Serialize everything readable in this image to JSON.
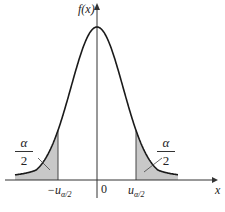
{
  "chart_data": {
    "type": "line",
    "title": "",
    "xlabel": "x",
    "ylabel": "f(x)",
    "tick_labels": [
      "-u_{α/2}",
      "0",
      "u_{α/2}"
    ],
    "annotations": [
      {
        "text": "α/2",
        "position": "left tail"
      },
      {
        "text": "α/2",
        "position": "right tail"
      }
    ],
    "shaded_regions": [
      "x < -u_{α/2}",
      "x > u_{α/2}"
    ],
    "grid": false,
    "legend": null
  },
  "labels": {
    "ylabel": "f(x)",
    "xlabel": "x",
    "origin": "0",
    "neg_crit": "−u",
    "pos_crit": "u",
    "crit_sub": "α/2",
    "frac_num": "α",
    "frac_den": "2"
  },
  "colors": {
    "curve": "#1a1a1a",
    "shade": "#c8c8c8",
    "axis": "#333333"
  }
}
